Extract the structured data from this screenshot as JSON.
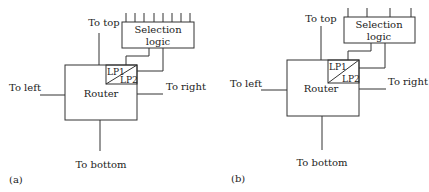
{
  "panels": {
    "a": {
      "caption": "(a)",
      "router_label": "Router",
      "lp1_label": "LP1",
      "lp2_label": "LP2",
      "selection_label_line1": "Selection",
      "selection_label_line2": "logic",
      "to_top": "To top",
      "to_left": "To left",
      "to_right": "To right",
      "to_bottom": "To bottom",
      "selection_inputs": 8
    },
    "b": {
      "caption": "(b)",
      "router_label": "Router",
      "lp1_label": "LP1",
      "lp2_label": "LP2",
      "selection_label_line1": "Selection",
      "selection_label_line2": "logic",
      "to_top": "To top",
      "to_left": "To left",
      "to_right": "To right",
      "to_bottom": "To bottom",
      "selection_inputs": 4
    }
  },
  "colors": {
    "line": "#333333",
    "text": "#222222",
    "background": "#ffffff"
  }
}
